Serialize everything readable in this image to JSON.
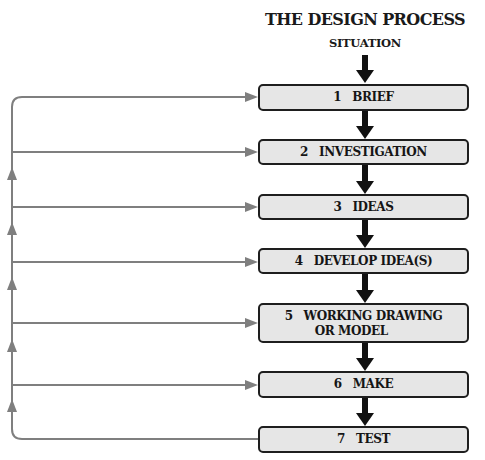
{
  "title": "THE DESIGN PROCESS",
  "start_label": "SITUATION",
  "colors": {
    "box_fill": "#e6e6e6",
    "box_border": "#1e1e1e",
    "flow_arrow": "#111111",
    "feedback_line": "#7f7f7f"
  },
  "steps": [
    {
      "number": "1",
      "label": "BRIEF"
    },
    {
      "number": "2",
      "label": "INVESTIGATION"
    },
    {
      "number": "3",
      "label": "IDEAS"
    },
    {
      "number": "4",
      "label": "DEVELOP IDEA(S)"
    },
    {
      "number": "5",
      "label": "WORKING DRAWING",
      "label_line2": "OR MODEL"
    },
    {
      "number": "6",
      "label": "MAKE"
    },
    {
      "number": "7",
      "label": "TEST"
    }
  ],
  "feedback": {
    "from": "7 TEST",
    "to": [
      "1 BRIEF",
      "2 INVESTIGATION",
      "3 IDEAS",
      "4 DEVELOP IDEA(S)",
      "5 WORKING DRAWING OR MODEL",
      "6 MAKE"
    ]
  }
}
